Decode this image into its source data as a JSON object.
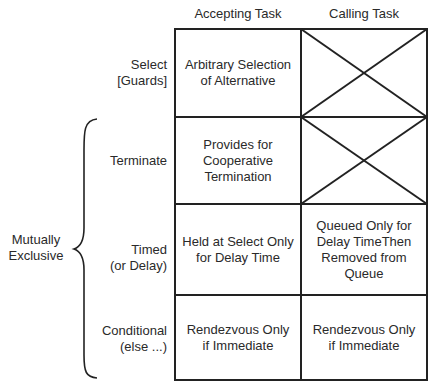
{
  "columns": [
    "Accepting Task",
    "Calling Task"
  ],
  "rows": [
    {
      "label": "Select\n[Guards]",
      "accepting": "Arbitrary Selection\nof Alternative",
      "calling": null,
      "calling_crossed": true
    },
    {
      "label": "Terminate",
      "accepting": "Provides for\nCooperative\nTermination",
      "calling": null,
      "calling_crossed": true
    },
    {
      "label": "Timed\n(or Delay)",
      "accepting": "Held at Select Only\nfor Delay Time",
      "calling": "Queued Only for\nDelay TimeThen\nRemoved from\nQueue",
      "calling_crossed": false
    },
    {
      "label": "Conditional\n(else ...)",
      "accepting": "Rendezvous Only\nif Immediate",
      "calling": "Rendezvous Only\nif Immediate",
      "calling_crossed": false
    }
  ],
  "group": {
    "label": "Mutually\nExclusive",
    "spans_rows": [
      "Terminate",
      "Timed\n(or Delay)",
      "Conditional\n(else ...)"
    ]
  },
  "colors": {
    "line": "#222222",
    "text": "#2a2a2a",
    "background": "#ffffff"
  }
}
